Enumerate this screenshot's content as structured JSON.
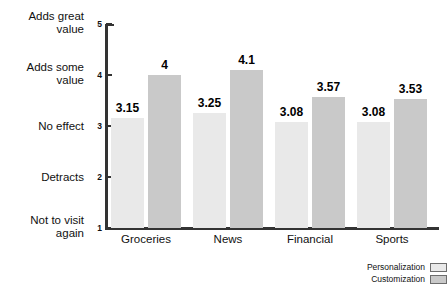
{
  "chart_data": {
    "type": "bar",
    "title": "",
    "xlabel": "",
    "ylabel": "",
    "ylim": [
      1,
      5
    ],
    "grid": false,
    "legend_position": "bottom-right",
    "categories": [
      "Groceries",
      "News",
      "Financial",
      "Sports"
    ],
    "series": [
      {
        "name": "Personalization",
        "color": "#e9e9e9",
        "values": [
          3.15,
          3.25,
          3.08,
          3.08
        ],
        "labels": [
          "3.15",
          "3.25",
          "3.08",
          "3.08"
        ]
      },
      {
        "name": "Customization",
        "color": "#c9c9c9",
        "values": [
          4,
          4.1,
          3.57,
          3.53
        ],
        "labels": [
          "4",
          "4.1",
          "3.57",
          "3.53"
        ]
      }
    ],
    "y_ticks": [
      {
        "value": 1,
        "number": "1",
        "label": "Not to visit\nagain"
      },
      {
        "value": 2,
        "number": "2",
        "label": "Detracts"
      },
      {
        "value": 3,
        "number": "3",
        "label": "No effect"
      },
      {
        "value": 4,
        "number": "4",
        "label": "Adds some\nvalue"
      },
      {
        "value": 5,
        "number": "5",
        "label": "Adds great\nvalue"
      }
    ]
  },
  "legend": {
    "items": [
      {
        "label": "Personalization",
        "color": "#e9e9e9"
      },
      {
        "label": "Customization",
        "color": "#c9c9c9"
      }
    ]
  },
  "colors": {
    "axis": "#333333",
    "text": "#111111",
    "background": "#ffffff",
    "series_1": "#e9e9e9",
    "series_2": "#c9c9c9"
  }
}
